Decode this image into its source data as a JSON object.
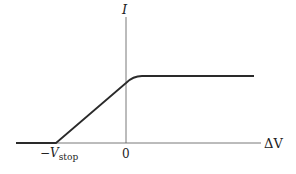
{
  "diagram": {
    "type": "current-voltage characteristic",
    "y_axis_label": "I",
    "x_axis_label": "ΔV",
    "ticks": {
      "origin": "0",
      "stop_prefix": "−V",
      "stop_subscript": "stop"
    },
    "curve": {
      "description": "Zero current for ΔV below −V_stop, linear rise from −V_stop through the I-axis, then saturates to a constant plateau",
      "segments": [
        "flat zero",
        "linear rise",
        "saturated plateau"
      ]
    },
    "colors": {
      "line": "#2a2a2a",
      "axis": "#555555",
      "background": "#ffffff"
    }
  }
}
